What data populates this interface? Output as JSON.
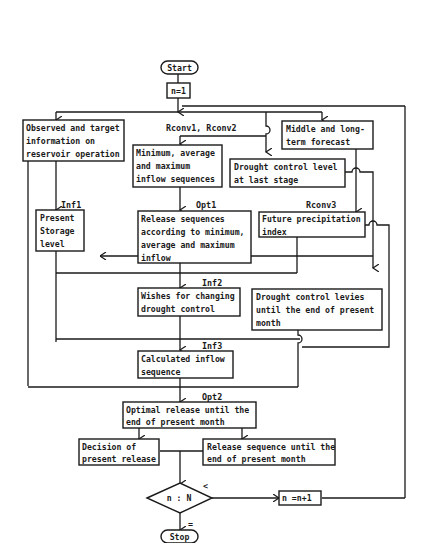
{
  "diagram": {
    "type": "flowchart",
    "colors": {
      "stroke": "#1a1a1a",
      "background": "#ffffff"
    },
    "start": {
      "label": "Start"
    },
    "init": {
      "label": "n=1"
    },
    "observed": {
      "lines": [
        "Observed and target",
        "information on",
        "reservoir operation"
      ]
    },
    "forecast": {
      "lines": [
        "Middle and long-",
        "term forecast"
      ]
    },
    "rconv12_label": "Rconv1, Rconv2",
    "inflow_seq": {
      "lines": [
        "Minimum, average",
        "and    maximum",
        "inflow sequences"
      ]
    },
    "drought_last": {
      "lines": [
        "Drought control level",
        "at last stage"
      ]
    },
    "inf1_label": "Inf1",
    "storage": {
      "lines": [
        "Present",
        "Storage",
        "level"
      ]
    },
    "opt1_label": "Opt1",
    "release_seq": {
      "lines": [
        "Release sequences",
        "according to minimum,",
        "average and maximum",
        "inflow"
      ]
    },
    "rconv3_label": "Rconv3",
    "precip": {
      "lines": [
        "Future precipitation",
        "index"
      ]
    },
    "inf2_label": "Inf2",
    "wishes": {
      "lines": [
        "Wishes for changing",
        "drought control"
      ]
    },
    "drought_levels": {
      "lines": [
        "Drought control levies",
        "until the end of present",
        "month"
      ]
    },
    "inf3_label": "Inf3",
    "calc_inflow": {
      "lines": [
        "Calculated inflow",
        "sequence"
      ]
    },
    "opt2_label": "Opt2",
    "optimal": {
      "lines": [
        "Optimal release until the",
        "end of present month"
      ]
    },
    "decision": {
      "lines": [
        "Decision of",
        "present release"
      ]
    },
    "release_month": {
      "lines": [
        "Release sequence until the",
        "end of present month"
      ]
    },
    "condition": {
      "label": "n : N",
      "less_label": "<",
      "equal_label": "="
    },
    "increment": {
      "label": "n =n+1"
    },
    "stop": {
      "label": "Stop"
    }
  }
}
